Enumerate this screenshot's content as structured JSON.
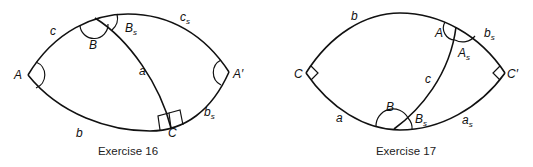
{
  "figures": [
    {
      "caption": "Exercise 16",
      "labels": {
        "A": "A",
        "A_prime": "A′",
        "B": "B",
        "B_s": "B",
        "B_s_sub": "s",
        "C": "C",
        "a": "a",
        "b": "b",
        "b_s": "b",
        "b_s_sub": "s",
        "c": "c",
        "c_s": "c",
        "c_s_sub": "s"
      }
    },
    {
      "caption": "Exercise 17",
      "labels": {
        "A": "A",
        "A_s": "A",
        "A_s_sub": "s",
        "B": "B",
        "B_s": "B",
        "B_s_sub": "s",
        "C": "C",
        "C_prime": "C′",
        "a": "a",
        "a_s": "a",
        "a_s_sub": "s",
        "b": "b",
        "b_s": "b",
        "b_s_sub": "s",
        "c": "c"
      }
    }
  ],
  "colors": {
    "stroke": "#111111",
    "background": "#ffffff"
  }
}
